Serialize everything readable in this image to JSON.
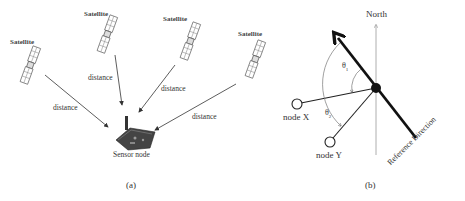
{
  "panel_a": {
    "caption": "(a)",
    "satellites": [
      {
        "label": "Satellite"
      },
      {
        "label": "Satellite"
      },
      {
        "label": "Satellite"
      },
      {
        "label": "Satellite"
      }
    ],
    "distance_labels": [
      "distance",
      "distance",
      "distance",
      "distance"
    ],
    "sensor_node_label": "Sensor node"
  },
  "panel_b": {
    "caption": "(b)",
    "north_label": "North",
    "node_x_label": "node X",
    "node_y_label": "node Y",
    "theta1_label": "θ",
    "theta1_sub": "1",
    "theta2_label": "θ",
    "theta2_sub": "2",
    "reference_label": "Reference Direction"
  },
  "colors": {
    "line": "#333333",
    "bold_arrow": "#111111",
    "north_axis": "#999999",
    "background": "#ffffff"
  }
}
